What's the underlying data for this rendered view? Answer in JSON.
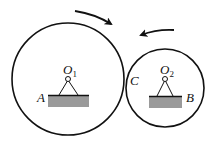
{
  "diagram": {
    "title": "",
    "labels": {
      "O1": {
        "main": "O",
        "sub": "1"
      },
      "O2": {
        "main": "O",
        "sub": "2"
      },
      "A": "A",
      "B": "B",
      "C": "C"
    },
    "circles": [
      {
        "name": "large-wheel",
        "cx": 68,
        "cy": 79,
        "r": 56
      },
      {
        "name": "small-wheel",
        "cx": 165,
        "cy": 88,
        "r": 40
      }
    ],
    "arrows": [
      {
        "name": "large-wheel-rotation-arrow",
        "direction": "clockwise"
      },
      {
        "name": "small-wheel-rotation-arrow",
        "direction": "counterclockwise"
      }
    ],
    "colors": {
      "stroke": "#111111",
      "ground": "#999999"
    }
  }
}
